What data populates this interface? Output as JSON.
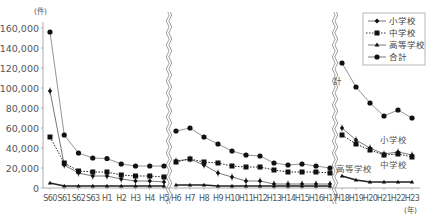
{
  "chart_data": {
    "type": "line",
    "title": "",
    "xlabel": "(年)",
    "ylabel": "(件)",
    "ylim": [
      0,
      160000
    ],
    "yticks": [
      0,
      20000,
      40000,
      60000,
      80000,
      100000,
      120000,
      140000,
      160000
    ],
    "ytick_labels": [
      "0",
      "20,000",
      "40,000",
      "60,000",
      "80,000",
      "100,000",
      "120,000",
      "140,000",
      "160,000"
    ],
    "grid": false,
    "legend_position": "top-right",
    "axis_breaks": [
      "between H5 and H6",
      "between H17 and H18"
    ],
    "categories": [
      "S60",
      "S61",
      "S62",
      "S63",
      "H1",
      "H2",
      "H3",
      "H4",
      "H5",
      "H6",
      "H7",
      "H8",
      "H9",
      "H10",
      "H11",
      "H12",
      "H13",
      "H14",
      "H15",
      "H16",
      "H17",
      "H18",
      "H19",
      "H20",
      "H21",
      "H22",
      "H23"
    ],
    "series": [
      {
        "name": "小学校",
        "marker": "diamond-cross",
        "line": "solid-thin",
        "values": [
          97000,
          23000,
          15000,
          12000,
          12000,
          9000,
          7000,
          7000,
          6000,
          27000,
          29000,
          23000,
          15000,
          11000,
          7000,
          7000,
          4000,
          4000,
          4000,
          4000,
          4000,
          60000,
          48000,
          40000,
          34000,
          36000,
          33000
        ]
      },
      {
        "name": "中学校",
        "marker": "square",
        "line": "dotted",
        "values": [
          51000,
          25000,
          17000,
          16000,
          16000,
          13000,
          12000,
          12000,
          11000,
          26000,
          29000,
          26000,
          25000,
          22000,
          21000,
          21000,
          18000,
          16000,
          16000,
          16000,
          15000,
          53000,
          44000,
          38000,
          33000,
          34000,
          31000
        ]
      },
      {
        "name": "高等学校",
        "marker": "triangle",
        "line": "solid-thick",
        "values": [
          5000,
          2000,
          2000,
          2000,
          2000,
          2000,
          2000,
          2000,
          2000,
          3000,
          3000,
          3000,
          2000,
          2000,
          2000,
          2000,
          2000,
          2000,
          2000,
          2000,
          2000,
          12000,
          8000,
          6000,
          6000,
          6000,
          6000
        ]
      },
      {
        "name": "合計",
        "marker": "circle",
        "line": "solid-thin",
        "values": [
          156000,
          53000,
          35000,
          30000,
          29500,
          24000,
          22000,
          22000,
          22000,
          57000,
          60000,
          51000,
          44000,
          37000,
          33000,
          32000,
          25000,
          23000,
          24000,
          22000,
          20000,
          125000,
          101000,
          85000,
          72000,
          78000,
          70000
        ]
      }
    ],
    "annotations": [
      {
        "text": "計",
        "near": "合計 H18"
      },
      {
        "text": "小学校",
        "near": "小学校 H22"
      },
      {
        "text": "中学校",
        "near": "中学校 H22"
      },
      {
        "text": "高等学校",
        "near": "高等学校 H18"
      }
    ]
  },
  "axis": {
    "y_unit": "(件)",
    "x_unit": "(年)"
  },
  "legend": {
    "items": [
      {
        "label": "小学校"
      },
      {
        "label": "中学校"
      },
      {
        "label": "高等学校"
      },
      {
        "label": "合計"
      }
    ]
  },
  "annotations": {
    "total": "計",
    "elementary": "小学校",
    "junior_high": "中学校",
    "high_school": "高等学校"
  },
  "colors": {
    "line": "#555555",
    "marker": "#111111",
    "axis": "#888888",
    "text": "#555555"
  }
}
